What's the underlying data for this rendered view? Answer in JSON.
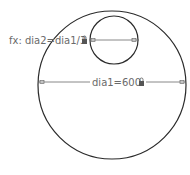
{
  "sketch": {
    "outer_circle": {
      "cx": 112,
      "cy": 85,
      "r": 74
    },
    "inner_circle": {
      "cx": 114,
      "cy": 40,
      "r": 24
    },
    "dimensions": [
      {
        "label": "fx: dia2=dia1/3",
        "locked": true
      },
      {
        "label": "dia1=600",
        "locked": true
      }
    ]
  },
  "colors": {
    "geometry": "#2a2a2a",
    "dimension": "#6a6a6a"
  }
}
